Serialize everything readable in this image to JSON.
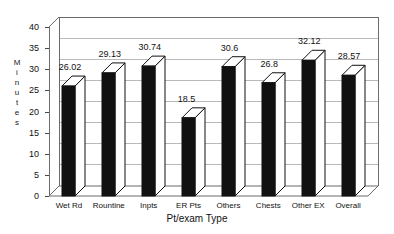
{
  "chart_data": {
    "type": "bar",
    "title": "",
    "subtitle": "",
    "xlabel": "Pt/exam Type",
    "ylabel": "Minutes",
    "categories": [
      "Wet Rd",
      "Rountine",
      "Inpts",
      "ER Pts",
      "Others",
      "Chests",
      "Other EX",
      "Overall"
    ],
    "values": [
      26.02,
      29.13,
      30.74,
      18.5,
      30.6,
      26.8,
      32.12,
      28.57
    ],
    "value_labels": [
      "26.02",
      "29.13",
      "30.74",
      "18.5",
      "30.6",
      "26.8",
      "32.12",
      "28.57"
    ],
    "ylim": [
      0,
      40
    ],
    "ytick_values": [
      0,
      5,
      10,
      15,
      20,
      25,
      30,
      35,
      40
    ],
    "ytick_labels": [
      "0",
      "5",
      "10",
      "15",
      "20",
      "25",
      "30",
      "35",
      "40"
    ],
    "grid": true,
    "grid_axis": "y",
    "legend": false,
    "legend_position": "none",
    "style": "3d-column",
    "bar_color": "#111111",
    "bar_top_color": "#ffffff",
    "bar_side_color": "#ffffff",
    "grid_color": "#b9b9b9",
    "axis_color": "#4a4a4a",
    "background_color": "#ffffff",
    "ylabel_letters": [
      "M",
      "i",
      "n",
      "u",
      "t",
      "e",
      "s"
    ]
  }
}
